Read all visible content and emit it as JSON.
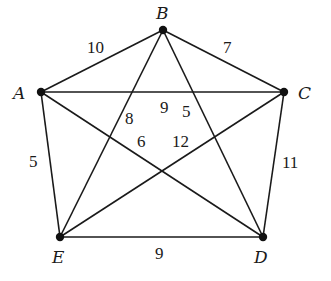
{
  "graph": {
    "nodes": [
      {
        "id": "A",
        "label": "A",
        "x": 41,
        "y": 92,
        "lx": 13,
        "ly": 99
      },
      {
        "id": "B",
        "label": "B",
        "x": 163,
        "y": 30,
        "lx": 156,
        "ly": 19
      },
      {
        "id": "C",
        "label": "C",
        "x": 284,
        "y": 92,
        "lx": 298,
        "ly": 99
      },
      {
        "id": "D",
        "label": "D",
        "x": 263,
        "y": 237,
        "lx": 254,
        "ly": 263
      },
      {
        "id": "E",
        "label": "E",
        "x": 60,
        "y": 237,
        "lx": 52,
        "ly": 263
      }
    ],
    "edges": [
      {
        "from": "A",
        "to": "B",
        "weight": "10",
        "lx": 87,
        "ly": 53
      },
      {
        "from": "B",
        "to": "C",
        "weight": "7",
        "lx": 223,
        "ly": 53
      },
      {
        "from": "A",
        "to": "C",
        "weight": "9",
        "lx": 160,
        "ly": 113
      },
      {
        "from": "B",
        "to": "D",
        "weight": "5",
        "lx": 182,
        "ly": 117
      },
      {
        "from": "B",
        "to": "E",
        "weight": "8",
        "lx": 125,
        "ly": 124
      },
      {
        "from": "A",
        "to": "D",
        "weight": "6",
        "lx": 137,
        "ly": 147
      },
      {
        "from": "C",
        "to": "E",
        "weight": "12",
        "lx": 172,
        "ly": 147
      },
      {
        "from": "A",
        "to": "E",
        "weight": "5",
        "lx": 29,
        "ly": 167
      },
      {
        "from": "C",
        "to": "D",
        "weight": "11",
        "lx": 282,
        "ly": 168
      },
      {
        "from": "E",
        "to": "D",
        "weight": "9",
        "lx": 155,
        "ly": 259
      }
    ]
  }
}
